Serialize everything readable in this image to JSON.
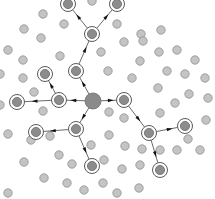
{
  "diagram": {
    "type": "network-propagation",
    "width": 215,
    "height": 199,
    "colors": {
      "background": "#ffffff",
      "node_fill": "#c4c4c4",
      "node_stroke": "#8f8f8f",
      "active_fill": "#8c8c8c",
      "active_stroke": "#6a6a6a",
      "ring_stroke": "#5a5a5a",
      "source_fill": "#8a8a8a",
      "edge": "#444444"
    },
    "source": {
      "id": "S",
      "x": 93,
      "y": 101,
      "r": 8
    },
    "active_nodes": [
      {
        "id": "A1",
        "x": 124,
        "y": 100
      },
      {
        "id": "A2",
        "x": 59,
        "y": 100
      },
      {
        "id": "A3",
        "x": 76,
        "y": 129
      },
      {
        "id": "A4",
        "x": 76,
        "y": 71
      },
      {
        "id": "A5",
        "x": 92,
        "y": 34
      },
      {
        "id": "A6",
        "x": 68,
        "y": 4
      },
      {
        "id": "A7",
        "x": 117,
        "y": 4
      },
      {
        "id": "A8",
        "x": 45,
        "y": 74
      },
      {
        "id": "A9",
        "x": 17,
        "y": 102
      },
      {
        "id": "A10",
        "x": 36,
        "y": 132
      },
      {
        "id": "A11",
        "x": 92,
        "y": 166
      },
      {
        "id": "A12",
        "x": 149,
        "y": 133
      },
      {
        "id": "A13",
        "x": 185,
        "y": 126
      },
      {
        "id": "A14",
        "x": 160,
        "y": 170
      }
    ],
    "edges": [
      {
        "from": "S",
        "to": "A1"
      },
      {
        "from": "S",
        "to": "A2"
      },
      {
        "from": "S",
        "to": "A3"
      },
      {
        "from": "S",
        "to": "A4"
      },
      {
        "from": "A4",
        "to": "A5"
      },
      {
        "from": "A5",
        "to": "A6"
      },
      {
        "from": "A5",
        "to": "A7"
      },
      {
        "from": "A2",
        "to": "A8"
      },
      {
        "from": "A2",
        "to": "A9"
      },
      {
        "from": "A3",
        "to": "A10"
      },
      {
        "from": "A3",
        "to": "A11"
      },
      {
        "from": "A1",
        "to": "A12"
      },
      {
        "from": "A12",
        "to": "A13"
      },
      {
        "from": "A12",
        "to": "A14"
      }
    ],
    "passive_nodes": [
      [
        92,
        1
      ],
      [
        43,
        14
      ],
      [
        64,
        24
      ],
      [
        141,
        34
      ],
      [
        24,
        29
      ],
      [
        41,
        38
      ],
      [
        117,
        24
      ],
      [
        161,
        30
      ],
      [
        8,
        50
      ],
      [
        23,
        60
      ],
      [
        60,
        56
      ],
      [
        101,
        52
      ],
      [
        124,
        42
      ],
      [
        143,
        41
      ],
      [
        159,
        52
      ],
      [
        177,
        50
      ],
      [
        0,
        74
      ],
      [
        23,
        78
      ],
      [
        108,
        71
      ],
      [
        140,
        61
      ],
      [
        167,
        71
      ],
      [
        185,
        74
      ],
      [
        34,
        92
      ],
      [
        158,
        88
      ],
      [
        132,
        78
      ],
      [
        189,
        94
      ],
      [
        0,
        105
      ],
      [
        43,
        111
      ],
      [
        109,
        112
      ],
      [
        124,
        118
      ],
      [
        175,
        103
      ],
      [
        160,
        113
      ],
      [
        8,
        134
      ],
      [
        31,
        140
      ],
      [
        50,
        136
      ],
      [
        59,
        155
      ],
      [
        109,
        135
      ],
      [
        91,
        145
      ],
      [
        125,
        146
      ],
      [
        142,
        149
      ],
      [
        177,
        150
      ],
      [
        24,
        162
      ],
      [
        72,
        164
      ],
      [
        104,
        160
      ],
      [
        122,
        169
      ],
      [
        140,
        165
      ],
      [
        160,
        150
      ],
      [
        44,
        178
      ],
      [
        67,
        183
      ],
      [
        84,
        190
      ],
      [
        103,
        183
      ],
      [
        117,
        193
      ],
      [
        139,
        188
      ],
      [
        8,
        193
      ],
      [
        188,
        139
      ],
      [
        200,
        150
      ],
      [
        206,
        120
      ],
      [
        208,
        98
      ],
      [
        205,
        78
      ],
      [
        195,
        60
      ]
    ]
  }
}
